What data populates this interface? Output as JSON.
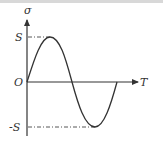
{
  "diagram": {
    "type": "sine-wave-plot",
    "labels": {
      "y_axis": "σ",
      "x_axis": "T",
      "origin": "O",
      "max": "S",
      "min": "-S"
    },
    "colors": {
      "curve": "#333333",
      "axis": "#333333",
      "guide": "#444444"
    }
  }
}
